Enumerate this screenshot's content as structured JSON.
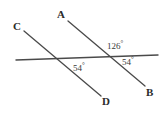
{
  "figure": {
    "kind": "geometry-diagram",
    "background_color": "#ffffff",
    "line_color": "#4a4a4a",
    "label_color": "#2b2b2b"
  },
  "points": {
    "A": {
      "label": "A",
      "x": 57,
      "y": 9
    },
    "B": {
      "label": "B",
      "x": 146,
      "y": 87
    },
    "C": {
      "label": "C",
      "x": 13,
      "y": 21
    },
    "D": {
      "label": "D",
      "x": 102,
      "y": 96
    }
  },
  "angles": {
    "upper_right": {
      "label": "126",
      "degree_symbol": "°",
      "value": 126,
      "x": 107,
      "y": 40
    },
    "lower_right": {
      "label": "54",
      "degree_symbol": "°",
      "value": 54,
      "x": 122,
      "y": 56
    },
    "lower_left_intersection": {
      "label": "54",
      "degree_symbol": "°",
      "value": 54,
      "x": 73,
      "y": 62
    }
  },
  "lines": {
    "transversal": {
      "name": "horizontal-transversal",
      "x1": 16,
      "y1": 60,
      "x2": 158,
      "y2": 55
    },
    "line_ab": {
      "name": "line-a-b",
      "x1": 68,
      "y1": 21,
      "x2": 145,
      "y2": 86
    },
    "line_cd": {
      "name": "line-c-d",
      "x1": 24,
      "y1": 31,
      "x2": 101,
      "y2": 96
    }
  }
}
